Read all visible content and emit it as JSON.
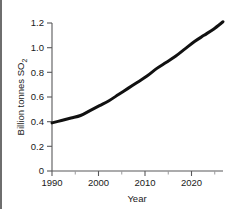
{
  "figure": {
    "background_color": "#ffffff",
    "line_color": "#111111",
    "axis_color": "#58585a",
    "text_color": "#1a1a1a"
  },
  "chart_data": {
    "type": "line",
    "title": "",
    "subtitle": "",
    "xlabel": "Year",
    "ylabel": "Billion tonnes SO2",
    "ylabel_display": "Billion tonnes SO",
    "ylabel_subscript": "2",
    "xlim": [
      1990,
      2026
    ],
    "ylim": [
      0,
      1.2
    ],
    "grid": false,
    "legend": null,
    "xticks": [
      1990,
      2000,
      2010,
      2020
    ],
    "xtick_labels": [
      "1990",
      "2000",
      "2010",
      "2020"
    ],
    "xminor_step": 5,
    "yticks": [
      0,
      0.2,
      0.4,
      0.6,
      0.8,
      1.0,
      1.2
    ],
    "ytick_labels": [
      "0",
      "0.2",
      "0.4",
      "0.6",
      "0.8",
      "1.0",
      "1.2"
    ],
    "series": [
      {
        "name": "Sulfur dioxide emissions",
        "x": [
          1990,
          1992,
          1994,
          1996,
          1998,
          2000,
          2002,
          2004,
          2006,
          2008,
          2010,
          2012,
          2014,
          2016,
          2018,
          2020,
          2022,
          2024,
          2026
        ],
        "values": [
          0.39,
          0.41,
          0.43,
          0.45,
          0.49,
          0.53,
          0.57,
          0.62,
          0.67,
          0.72,
          0.77,
          0.83,
          0.88,
          0.93,
          0.99,
          1.05,
          1.1,
          1.15,
          1.21
        ]
      }
    ]
  },
  "artifacts": {
    "top_left_smudge": "",
    "top_right_smudge": ""
  }
}
